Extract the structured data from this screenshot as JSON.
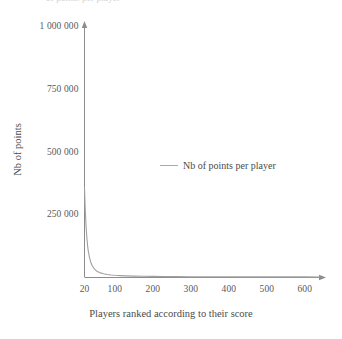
{
  "figure": {
    "top_clipped_fragment": "of points per player",
    "axis_color": "#8c8c8c",
    "series_color": "#a0a0a0",
    "text_color": "#555555"
  },
  "chart_data": {
    "type": "line",
    "title": "",
    "xlabel": "Players ranked according to their score",
    "ylabel": "Nb of points",
    "legend": [
      {
        "name": "Nb of points per player",
        "color": "#a0a0a0"
      }
    ],
    "legend_position": "center",
    "grid": false,
    "xlim": [
      20,
      640
    ],
    "ylim": [
      0,
      1000000
    ],
    "xticks": [
      20,
      100,
      200,
      300,
      400,
      500,
      600
    ],
    "xticklabels": [
      "20",
      "100",
      "200",
      "300",
      "400",
      "500",
      "600"
    ],
    "yticks": [
      250000,
      500000,
      750000,
      1000000
    ],
    "yticklabels": [
      "250 000",
      "500 000",
      "750 000",
      "1 000 000"
    ],
    "series": [
      {
        "name": "Nb of points per player",
        "x": [
          20,
          22,
          24,
          26,
          28,
          30,
          33,
          36,
          40,
          45,
          50,
          55,
          60,
          70,
          80,
          90,
          100,
          115,
          130,
          150,
          175,
          200,
          230,
          260,
          300,
          350,
          400,
          450,
          500,
          550,
          600,
          640
        ],
        "values": [
          355000,
          268000,
          205000,
          160000,
          127000,
          103000,
          78000,
          61000,
          46000,
          33500,
          26000,
          21000,
          17500,
          13000,
          10000,
          8200,
          6900,
          5500,
          4500,
          3600,
          2800,
          2300,
          1800,
          1500,
          1200,
          900,
          700,
          560,
          460,
          380,
          320,
          280
        ]
      }
    ]
  }
}
